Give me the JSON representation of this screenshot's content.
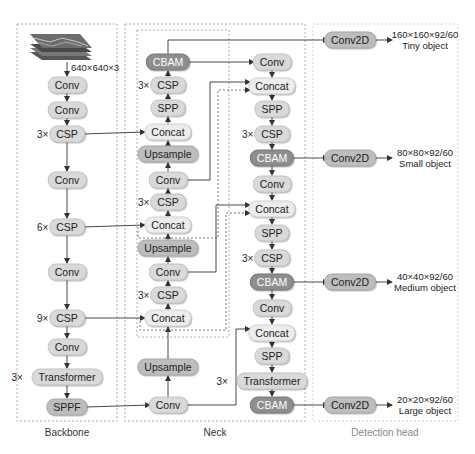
{
  "input": {
    "label": "640×640×3",
    "icon": "image-stack-icon"
  },
  "sections": {
    "backbone": "Backbone",
    "neck": "Neck",
    "head": "Detection head"
  },
  "backbone": {
    "nodes": [
      {
        "id": "b1",
        "label": "Conv",
        "x": 67,
        "y": 85,
        "style": "lvl1"
      },
      {
        "id": "b2",
        "label": "Conv",
        "x": 67,
        "y": 110,
        "style": "lvl1"
      },
      {
        "id": "b3",
        "label": "CSP",
        "x": 67,
        "y": 134,
        "style": "lvl1",
        "mult": "3×"
      },
      {
        "id": "b4",
        "label": "Conv",
        "x": 67,
        "y": 180,
        "style": "lvl1"
      },
      {
        "id": "b5",
        "label": "CSP",
        "x": 67,
        "y": 227,
        "style": "lvl1",
        "mult": "6×"
      },
      {
        "id": "b6",
        "label": "Conv",
        "x": 67,
        "y": 272,
        "style": "lvl1"
      },
      {
        "id": "b7",
        "label": "CSP",
        "x": 67,
        "y": 318,
        "style": "lvl1",
        "mult": "9×"
      },
      {
        "id": "b8",
        "label": "Conv",
        "x": 67,
        "y": 347,
        "style": "lvl1"
      },
      {
        "id": "b9",
        "label": "Transformer",
        "x": 67,
        "y": 377,
        "style": "lvl1",
        "mult": "3×"
      },
      {
        "id": "b10",
        "label": "SPPF",
        "x": 67,
        "y": 407,
        "style": "lvl2"
      }
    ]
  },
  "neck": {
    "left": [
      {
        "id": "nl1",
        "label": "CBAM",
        "x": 168,
        "y": 62,
        "style": "lvl3"
      },
      {
        "id": "nl2",
        "label": "CSP",
        "x": 168,
        "y": 85,
        "style": "lvl1",
        "mult": "3×"
      },
      {
        "id": "nl3",
        "label": "SPP",
        "x": 168,
        "y": 108,
        "style": "lvl1"
      },
      {
        "id": "nl4",
        "label": "Concat",
        "x": 168,
        "y": 132,
        "style": "lvl0"
      },
      {
        "id": "nl5",
        "label": "Upsample",
        "x": 168,
        "y": 154,
        "style": "lvl2"
      },
      {
        "id": "nl6",
        "label": "Conv",
        "x": 168,
        "y": 180,
        "style": "lvl1"
      },
      {
        "id": "nl7",
        "label": "CSP",
        "x": 168,
        "y": 202,
        "style": "lvl1",
        "mult": "3×"
      },
      {
        "id": "nl8",
        "label": "Concat",
        "x": 168,
        "y": 225,
        "style": "lvl0"
      },
      {
        "id": "nl9",
        "label": "Upsample",
        "x": 168,
        "y": 248,
        "style": "lvl2"
      },
      {
        "id": "nl10",
        "label": "Conv",
        "x": 168,
        "y": 272,
        "style": "lvl1"
      },
      {
        "id": "nl11",
        "label": "CSP",
        "x": 168,
        "y": 295,
        "style": "lvl1",
        "mult": "3×"
      },
      {
        "id": "nl12",
        "label": "Concat",
        "x": 168,
        "y": 318,
        "style": "lvl0"
      },
      {
        "id": "nl13",
        "label": "Upsample",
        "x": 168,
        "y": 367,
        "style": "lvl2"
      },
      {
        "id": "nl14",
        "label": "Conv",
        "x": 168,
        "y": 405,
        "style": "lvl1"
      }
    ],
    "right": [
      {
        "id": "nr1",
        "label": "Conv",
        "x": 272,
        "y": 62,
        "style": "lvl1"
      },
      {
        "id": "nr2",
        "label": "Concat",
        "x": 272,
        "y": 86,
        "style": "lvl0"
      },
      {
        "id": "nr3",
        "label": "SPP",
        "x": 272,
        "y": 109,
        "style": "lvl1"
      },
      {
        "id": "nr4",
        "label": "CSP",
        "x": 272,
        "y": 134,
        "style": "lvl1",
        "mult": "3×"
      },
      {
        "id": "nr5",
        "label": "CBAM",
        "x": 272,
        "y": 158,
        "style": "lvl3"
      },
      {
        "id": "nr6",
        "label": "Conv",
        "x": 272,
        "y": 184,
        "style": "lvl1"
      },
      {
        "id": "nr7",
        "label": "Concat",
        "x": 272,
        "y": 209,
        "style": "lvl0"
      },
      {
        "id": "nr8",
        "label": "SPP",
        "x": 272,
        "y": 233,
        "style": "lvl1"
      },
      {
        "id": "nr9",
        "label": "CSP",
        "x": 272,
        "y": 258,
        "style": "lvl1",
        "mult": "3×"
      },
      {
        "id": "nr10",
        "label": "CBAM",
        "x": 272,
        "y": 282,
        "style": "lvl3"
      },
      {
        "id": "nr11",
        "label": "Conv",
        "x": 272,
        "y": 308,
        "style": "lvl1"
      },
      {
        "id": "nr12",
        "label": "Concat",
        "x": 272,
        "y": 333,
        "style": "lvl0"
      },
      {
        "id": "nr13",
        "label": "SPP",
        "x": 272,
        "y": 356,
        "style": "lvl1"
      },
      {
        "id": "nr14",
        "label": "Transformer",
        "x": 272,
        "y": 381,
        "style": "lvl1",
        "mult": "3×"
      },
      {
        "id": "nr15",
        "label": "CBAM",
        "x": 272,
        "y": 405,
        "style": "lvl3"
      }
    ]
  },
  "head": {
    "nodes": [
      {
        "id": "h1",
        "label": "Conv2D",
        "x": 350,
        "y": 40,
        "style": "lvl2",
        "out_size": "160×160×92/60",
        "out_name": "Tiny object"
      },
      {
        "id": "h2",
        "label": "Conv2D",
        "x": 350,
        "y": 158,
        "style": "lvl2",
        "out_size": "80×80×92/60",
        "out_name": "Small object"
      },
      {
        "id": "h3",
        "label": "Conv2D",
        "x": 350,
        "y": 282,
        "style": "lvl2",
        "out_size": "40×40×92/60",
        "out_name": "Medium object"
      },
      {
        "id": "h4",
        "label": "Conv2D",
        "x": 350,
        "y": 405,
        "style": "lvl2",
        "out_size": "20×20×92/60",
        "out_name": "Large object"
      }
    ]
  },
  "colors": {
    "line": "#333333",
    "dashed_box": "#9a9a9a",
    "node_light": "#ececec",
    "node_mid": "#d9d9d9",
    "node_dark": "#bdbdbd",
    "cbam": "#8e8e8e"
  }
}
